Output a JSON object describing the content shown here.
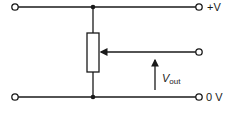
{
  "diagram": {
    "type": "potentiometer voltage divider circuit",
    "labels": {
      "supply_positive": "+V",
      "ground": "0 V",
      "output_main": "V",
      "output_sub": "out"
    },
    "components": [
      {
        "kind": "resistor",
        "name": "potentiometer"
      },
      {
        "kind": "wiper",
        "name": "potentiometer-wiper"
      },
      {
        "kind": "terminal",
        "name": "top-left-terminal"
      },
      {
        "kind": "terminal",
        "name": "top-right-terminal"
      },
      {
        "kind": "terminal",
        "name": "wiper-terminal"
      },
      {
        "kind": "terminal",
        "name": "bottom-left-terminal"
      },
      {
        "kind": "terminal",
        "name": "bottom-right-terminal"
      },
      {
        "kind": "junction",
        "name": "top-junction"
      },
      {
        "kind": "junction",
        "name": "bottom-junction"
      }
    ],
    "colors": {
      "ink": "#1a1a1a",
      "background": "#ffffff"
    }
  }
}
